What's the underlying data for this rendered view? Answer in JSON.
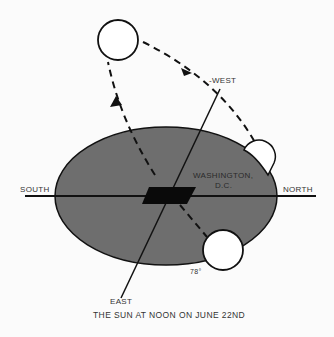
{
  "diagram": {
    "labels": {
      "west": "-WEST",
      "south": "SOUTH",
      "north": "NORTH",
      "east": "EAST",
      "city": "WASHINGTON,",
      "city2": "D.C.",
      "angle": "78°"
    },
    "caption": "THE SUN AT NOON ON JUNE 22ND",
    "colors": {
      "ground": "#6e6e6e",
      "lines": "#111111",
      "sun": "#ffffff",
      "background": "#fbfbfb"
    }
  }
}
